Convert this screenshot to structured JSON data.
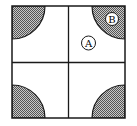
{
  "diagram": {
    "labels": {
      "region_a": "A",
      "region_b": "B"
    },
    "colors": {
      "stroke": "#1a1a1a",
      "shade": "#8a8a8a",
      "background": "#ffffff"
    }
  }
}
